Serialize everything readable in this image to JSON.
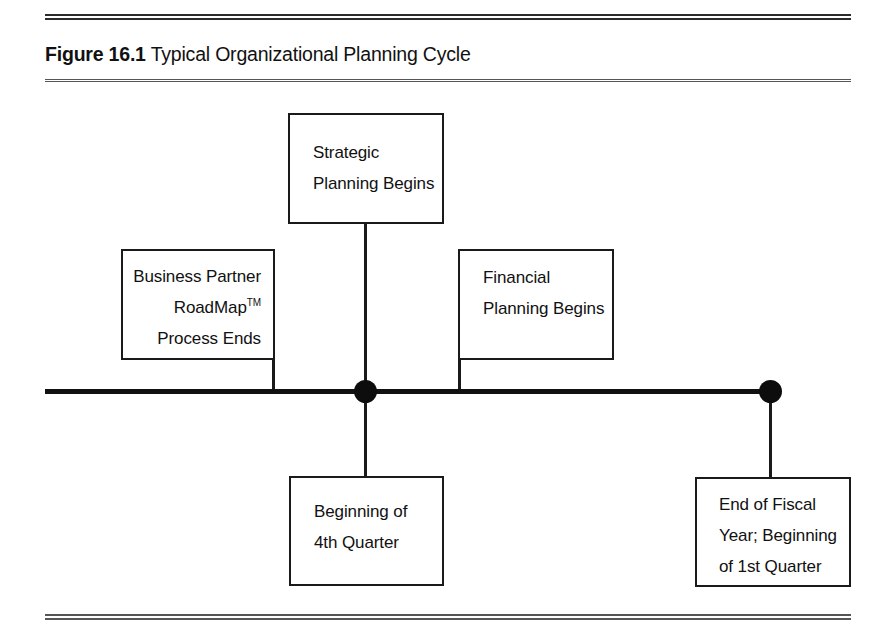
{
  "figure": {
    "caption_label": "Figure 16.1",
    "caption_text": "Typical Organizational Planning Cycle",
    "line_color": "#1a1a1a",
    "background_color": "#ffffff",
    "text_color": "#111111"
  },
  "diagram": {
    "type": "timeline",
    "axis_label": "planning cycle timeline",
    "nodes": [
      {
        "name": "beginning-of-4th-quarter-node",
        "x_px": 365
      },
      {
        "name": "end-of-fiscal-year-node",
        "x_px": 770
      }
    ],
    "boxes": {
      "strategic": {
        "name": "Strategic Planning Begins",
        "lines": [
          "Strategic",
          "Planning Begins"
        ],
        "position": "above-timeline",
        "align": "left"
      },
      "business_partner": {
        "name": "Business Partner RoadMap Process Ends",
        "lines": [
          "Business Partner",
          "RoadMap",
          "Process Ends"
        ],
        "trademark_line_index": 1,
        "trademark_symbol": "TM",
        "position": "above-timeline",
        "align": "right"
      },
      "financial": {
        "name": "Financial Planning Begins",
        "lines": [
          "Financial",
          "Planning Begins"
        ],
        "position": "above-timeline",
        "align": "left"
      },
      "quarter4": {
        "name": "Beginning of 4th Quarter",
        "lines": [
          "Beginning of",
          "4th Quarter"
        ],
        "position": "below-timeline",
        "align": "left"
      },
      "fiscal_year": {
        "name": "End of Fiscal Year; Beginning of 1st Quarter",
        "lines": [
          "End of Fiscal",
          "Year; Beginning",
          "of 1st Quarter"
        ],
        "position": "below-timeline",
        "align": "left"
      }
    }
  },
  "chart_data": {
    "type": "table",
    "title": "Typical Organizational Planning Cycle",
    "categories": [
      "Business Partner RoadMap™ Process Ends",
      "Strategic Planning Begins",
      "Beginning of 4th Quarter",
      "Financial Planning Begins",
      "End of Fiscal Year; Beginning of 1st Quarter"
    ],
    "annotations": [
      "Business Partner RoadMap™ Process Ends",
      "Strategic Planning Begins",
      "Financial Planning Begins",
      "Beginning of 4th Quarter",
      "End of Fiscal Year; Beginning of 1st Quarter"
    ],
    "xlabel": "",
    "ylabel": "",
    "grid": false,
    "legend_position": "none"
  }
}
